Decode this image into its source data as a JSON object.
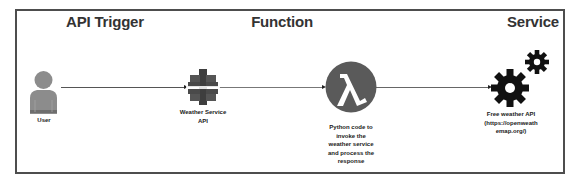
{
  "headings": {
    "trigger": "API Trigger",
    "function": "Function",
    "service": "Service"
  },
  "nodes": {
    "user": {
      "icon": "user-icon",
      "label": "User"
    },
    "api": {
      "icon": "api-gateway-icon",
      "label_lines": [
        "Weather Service",
        "API"
      ]
    },
    "lambda": {
      "icon": "lambda-icon",
      "glyph": "λ",
      "label_lines": [
        "Python code to",
        "invoke the",
        "weather service",
        "and process the",
        "response"
      ]
    },
    "service": {
      "icon": "gears-icon",
      "label_lines": [
        "Free weather API",
        "(https://openweath",
        "emap.org/)"
      ]
    }
  },
  "edges": [
    {
      "from": "user",
      "to": "api"
    },
    {
      "from": "api",
      "to": "lambda"
    },
    {
      "from": "lambda",
      "to": "service"
    }
  ],
  "colors": {
    "frame": "#4d4d4d",
    "user_icon": "#8c8c8c",
    "api_icon": "#4a4a4a",
    "lambda_circle": "#5a5a5a",
    "gears": "#111111"
  }
}
